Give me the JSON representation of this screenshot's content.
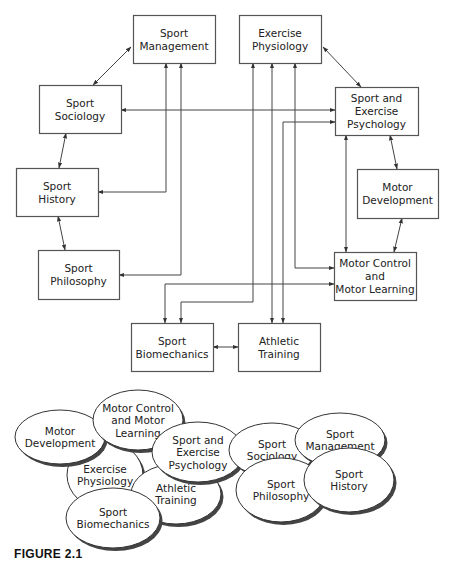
{
  "figure": {
    "caption": "FIGURE 2.1",
    "colors": {
      "stroke": "#555555",
      "text": "#222222",
      "shadow": "#444444",
      "background": "#ffffff"
    }
  },
  "boxes": [
    {
      "id": "sport-management",
      "lines": [
        "Sport",
        "Management"
      ],
      "x": 133,
      "y": 15,
      "w": 82,
      "h": 48
    },
    {
      "id": "exercise-physiology",
      "lines": [
        "Exercise",
        "Physiology"
      ],
      "x": 239,
      "y": 15,
      "w": 82,
      "h": 48
    },
    {
      "id": "sport-sociology",
      "lines": [
        "Sport",
        "Sociology"
      ],
      "x": 39,
      "y": 85,
      "w": 82,
      "h": 48
    },
    {
      "id": "sport-exercise-psychology",
      "lines": [
        "Sport and",
        "Exercise",
        "Psychology"
      ],
      "x": 335,
      "y": 87,
      "w": 83,
      "h": 48
    },
    {
      "id": "sport-history",
      "lines": [
        "Sport",
        "History"
      ],
      "x": 16,
      "y": 168,
      "w": 82,
      "h": 48
    },
    {
      "id": "motor-development",
      "lines": [
        "Motor",
        "Development"
      ],
      "x": 357,
      "y": 169,
      "w": 81,
      "h": 49
    },
    {
      "id": "sport-philosophy",
      "lines": [
        "Sport",
        "Philosophy"
      ],
      "x": 38,
      "y": 250,
      "w": 81,
      "h": 49
    },
    {
      "id": "motor-control-learning",
      "lines": [
        "Motor Control",
        "and",
        "Motor Learning"
      ],
      "x": 334,
      "y": 252,
      "w": 82,
      "h": 48
    },
    {
      "id": "sport-biomechanics",
      "lines": [
        "Sport",
        "Biomechanics"
      ],
      "x": 131,
      "y": 323,
      "w": 82,
      "h": 48
    },
    {
      "id": "athletic-training",
      "lines": [
        "Athletic",
        "Training"
      ],
      "x": 238,
      "y": 323,
      "w": 82,
      "h": 48
    }
  ],
  "ellipses": [
    {
      "id": "exercise-physiology",
      "lines": [
        "Exercise",
        "Physiology"
      ],
      "cx": 105,
      "cy": 475,
      "rx": 38,
      "ry": 34
    },
    {
      "id": "motor-development",
      "lines": [
        "Motor",
        "Development"
      ],
      "cx": 60,
      "cy": 437,
      "rx": 45,
      "ry": 27
    },
    {
      "id": "motor-control-learning",
      "lines": [
        "Motor Control",
        "and Motor",
        "Learning"
      ],
      "cx": 138,
      "cy": 420,
      "rx": 45,
      "ry": 30
    },
    {
      "id": "athletic-training",
      "lines": [
        "Athletic",
        "Training"
      ],
      "cx": 176,
      "cy": 494,
      "rx": 45,
      "ry": 30
    },
    {
      "id": "sport-biomechanics",
      "lines": [
        "Sport",
        "Biomechanics"
      ],
      "cx": 113,
      "cy": 518,
      "rx": 47,
      "ry": 30
    },
    {
      "id": "sport-exercise-psychology",
      "lines": [
        "Sport and",
        "Exercise",
        "Psychology"
      ],
      "cx": 198,
      "cy": 452,
      "rx": 46,
      "ry": 30
    },
    {
      "id": "sport-sociology",
      "lines": [
        "Sport",
        "Sociology"
      ],
      "cx": 272,
      "cy": 450,
      "rx": 43,
      "ry": 27
    },
    {
      "id": "sport-philosophy",
      "lines": [
        "Sport",
        "Philosophy"
      ],
      "cx": 281,
      "cy": 490,
      "rx": 45,
      "ry": 32
    },
    {
      "id": "sport-management",
      "lines": [
        "Sport",
        "Management"
      ],
      "cx": 340,
      "cy": 440,
      "rx": 45,
      "ry": 27
    },
    {
      "id": "sport-history",
      "lines": [
        "Sport",
        "History"
      ],
      "cx": 349,
      "cy": 480,
      "rx": 45,
      "ry": 32
    }
  ],
  "connectors": [
    {
      "id": "management-sociology",
      "points": [
        [
          131,
          47
        ],
        [
          93,
          85
        ]
      ],
      "start_arrow": true,
      "end_arrow": true
    },
    {
      "id": "physiology-psychology",
      "points": [
        [
          323,
          47
        ],
        [
          361,
          87
        ]
      ],
      "start_arrow": true,
      "end_arrow": true
    },
    {
      "id": "sociology-history",
      "points": [
        [
          66,
          133
        ],
        [
          59,
          168
        ]
      ],
      "start_arrow": true,
      "end_arrow": true
    },
    {
      "id": "history-philosophy",
      "points": [
        [
          58,
          216
        ],
        [
          65,
          250
        ]
      ],
      "start_arrow": true,
      "end_arrow": true
    },
    {
      "id": "psychology-motordev",
      "points": [
        [
          390,
          135
        ],
        [
          397,
          169
        ]
      ],
      "start_arrow": true,
      "end_arrow": true
    },
    {
      "id": "motordev-motorcontrol",
      "points": [
        [
          402,
          218
        ],
        [
          394,
          252
        ]
      ],
      "start_arrow": true,
      "end_arrow": true
    },
    {
      "id": "psychology-motorcontrol",
      "points": [
        [
          346,
          135
        ],
        [
          346,
          252
        ]
      ],
      "start_arrow": true,
      "end_arrow": true
    },
    {
      "id": "biomech-athletic",
      "points": [
        [
          213,
          347
        ],
        [
          238,
          347
        ]
      ],
      "start_arrow": true,
      "end_arrow": true
    },
    {
      "id": "history-management",
      "points": [
        [
          98,
          192
        ],
        [
          166,
          192
        ],
        [
          166,
          63
        ]
      ],
      "start_arrow": true,
      "end_arrow": true
    },
    {
      "id": "philosophy-management",
      "points": [
        [
          119,
          275
        ],
        [
          181,
          275
        ],
        [
          181,
          63
        ]
      ],
      "start_arrow": true,
      "end_arrow": true
    },
    {
      "id": "sociology-psychology",
      "points": [
        [
          121,
          110
        ],
        [
          335,
          110
        ]
      ],
      "start_arrow": true,
      "end_arrow": true
    },
    {
      "id": "physiology-psychology-bus",
      "points": [
        [
          283,
          323
        ],
        [
          283,
          122
        ],
        [
          335,
          122
        ]
      ],
      "start_arrow": true,
      "end_arrow": true
    },
    {
      "id": "physiology-motorcontrol",
      "points": [
        [
          295,
          63
        ],
        [
          295,
          268
        ],
        [
          334,
          268
        ]
      ],
      "start_arrow": true,
      "end_arrow": true
    },
    {
      "id": "biomech-motorcontrol",
      "points": [
        [
          165,
          323
        ],
        [
          165,
          284
        ],
        [
          334,
          284
        ]
      ],
      "start_arrow": true,
      "end_arrow": true
    },
    {
      "id": "physiology-biomech",
      "points": [
        [
          253,
          63
        ],
        [
          253,
          302
        ],
        [
          181,
          302
        ],
        [
          181,
          323
        ]
      ],
      "start_arrow": true,
      "end_arrow": true
    },
    {
      "id": "physiology-athletic",
      "points": [
        [
          272,
          63
        ],
        [
          272,
          323
        ]
      ],
      "start_arrow": true,
      "end_arrow": true
    }
  ]
}
